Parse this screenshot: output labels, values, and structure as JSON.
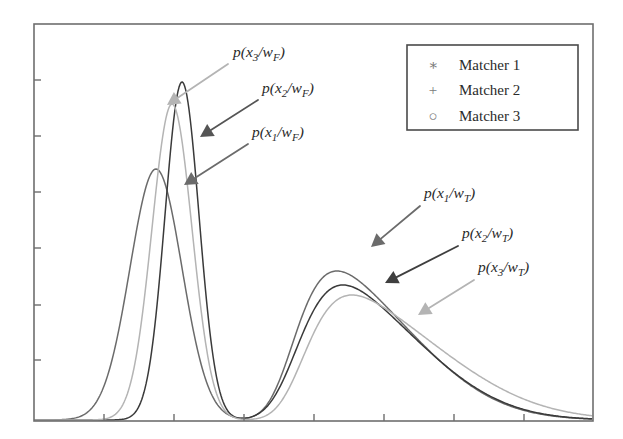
{
  "figure": {
    "background_color": "#ffffff",
    "frame": {
      "x": 34,
      "y": 24,
      "width": 559,
      "height": 397,
      "border_color": "#6e6e6e",
      "border_width": 1.6
    },
    "axes": {
      "x_tick_positions": [
        104,
        174,
        244,
        314,
        384,
        454,
        524
      ],
      "y_tick_positions": [
        80,
        136,
        192,
        248,
        305,
        360
      ],
      "tick_length": 7,
      "tick_color": "#6e6e6e",
      "x_tick_labels": [],
      "y_tick_labels": [],
      "grid": false
    }
  },
  "series_colors": {
    "matcher1": "#6b6b6b",
    "matcher2": "#3a3a3a",
    "matcher3": "#b4b4b4"
  },
  "legend": {
    "box": {
      "x": 407,
      "y": 45,
      "width": 171,
      "height": 85
    },
    "border_color": "#4a4a4a",
    "background_color": "#ffffff",
    "position": "top-right",
    "entries": [
      {
        "marker": "asterisk-marker",
        "glyph": "∗",
        "label": "Matcher 1",
        "color": "#6b6b6b"
      },
      {
        "marker": "plus-marker",
        "glyph": "+",
        "label": "Matcher 2",
        "color": "#3a3a3a"
      },
      {
        "marker": "circle-marker",
        "glyph": "○",
        "label": "Matcher 3",
        "color": "#b4b4b4"
      }
    ]
  },
  "annotations": [
    {
      "id": "label-x3-wF",
      "text_prefix": "p(x",
      "subscript": "3",
      "text_mid": "/w",
      "subscript2": "F",
      "text_suffix": ")",
      "full_text": "p(x3/wF)",
      "color": "#b4b4b4",
      "text_x": 233,
      "text_y": 57,
      "arrow_from_x": 228,
      "arrow_from_y": 64,
      "arrow_to_x": 167,
      "arrow_to_y": 105
    },
    {
      "id": "label-x2-wF",
      "text_prefix": "p(x",
      "subscript": "2",
      "text_mid": "/w",
      "subscript2": "F",
      "text_suffix": ")",
      "full_text": "p(x2/wF)",
      "color": "#555555",
      "text_x": 262,
      "text_y": 93,
      "arrow_from_x": 258,
      "arrow_from_y": 100,
      "arrow_to_x": 200,
      "arrow_to_y": 137
    },
    {
      "id": "label-x1-wF",
      "text_prefix": "p(x",
      "subscript": "1",
      "text_mid": "/w",
      "subscript2": "F",
      "text_suffix": ")",
      "full_text": "p(x1/wF)",
      "color": "#6b6b6b",
      "text_x": 252,
      "text_y": 137,
      "arrow_from_x": 248,
      "arrow_from_y": 144,
      "arrow_to_x": 184,
      "arrow_to_y": 185
    },
    {
      "id": "label-x1-wT",
      "text_prefix": "p(x",
      "subscript": "1",
      "text_mid": "/w",
      "subscript2": "T",
      "text_suffix": ")",
      "full_text": "p(x1/wT)",
      "color": "#6b6b6b",
      "text_x": 424,
      "text_y": 198,
      "arrow_from_x": 420,
      "arrow_from_y": 206,
      "arrow_to_x": 371,
      "arrow_to_y": 247
    },
    {
      "id": "label-x2-wT",
      "text_prefix": "p(x",
      "subscript": "2",
      "text_mid": "/w",
      "subscript2": "T",
      "text_suffix": ")",
      "full_text": "p(x2/wT)",
      "color": "#3f3f3f",
      "text_x": 462,
      "text_y": 238,
      "arrow_from_x": 458,
      "arrow_from_y": 246,
      "arrow_to_x": 385,
      "arrow_to_y": 283
    },
    {
      "id": "label-x3-wT",
      "text_prefix": "p(x",
      "subscript": "3",
      "text_mid": "/w",
      "subscript2": "T",
      "text_suffix": ")",
      "full_text": "p(x3/wT)",
      "color": "#b4b4b4",
      "text_x": 478,
      "text_y": 272,
      "arrow_from_x": 474,
      "arrow_from_y": 280,
      "arrow_to_x": 418,
      "arrow_to_y": 315
    }
  ],
  "chart_data": {
    "type": "line",
    "title": "",
    "xlabel": "",
    "ylabel": "",
    "xlim": [
      34,
      593
    ],
    "ylim": [
      421,
      24
    ],
    "grid": false,
    "legend_position": "top-right",
    "series": [
      {
        "name": "Matcher 1",
        "color": "#6b6b6b",
        "marker": "asterisk-marker",
        "components": [
          {
            "class": "wF",
            "peak_x": 156,
            "peak_y": 170,
            "amplitude": 251,
            "sigma": 26,
            "skew": 0.0
          },
          {
            "class": "wT",
            "peak_x": 337,
            "peak_y": 272,
            "amplitude": 149,
            "sigma": 52,
            "skew": 0.55
          }
        ]
      },
      {
        "name": "Matcher 2",
        "color": "#3a3a3a",
        "marker": "plus-marker",
        "components": [
          {
            "class": "wF",
            "peak_x": 182,
            "peak_y": 83,
            "amplitude": 338,
            "sigma": 17,
            "skew": 0.0
          },
          {
            "class": "wT",
            "peak_x": 343,
            "peak_y": 286,
            "amplitude": 135,
            "sigma": 54,
            "skew": 0.5
          }
        ]
      },
      {
        "name": "Matcher 3",
        "color": "#b4b4b4",
        "marker": "circle-marker",
        "components": [
          {
            "class": "wF",
            "peak_x": 172,
            "peak_y": 105,
            "amplitude": 316,
            "sigma": 20,
            "skew": 0.0
          },
          {
            "class": "wT",
            "peak_x": 352,
            "peak_y": 296,
            "amplitude": 125,
            "sigma": 58,
            "skew": 0.6
          }
        ]
      }
    ],
    "baseline_y": 420
  }
}
